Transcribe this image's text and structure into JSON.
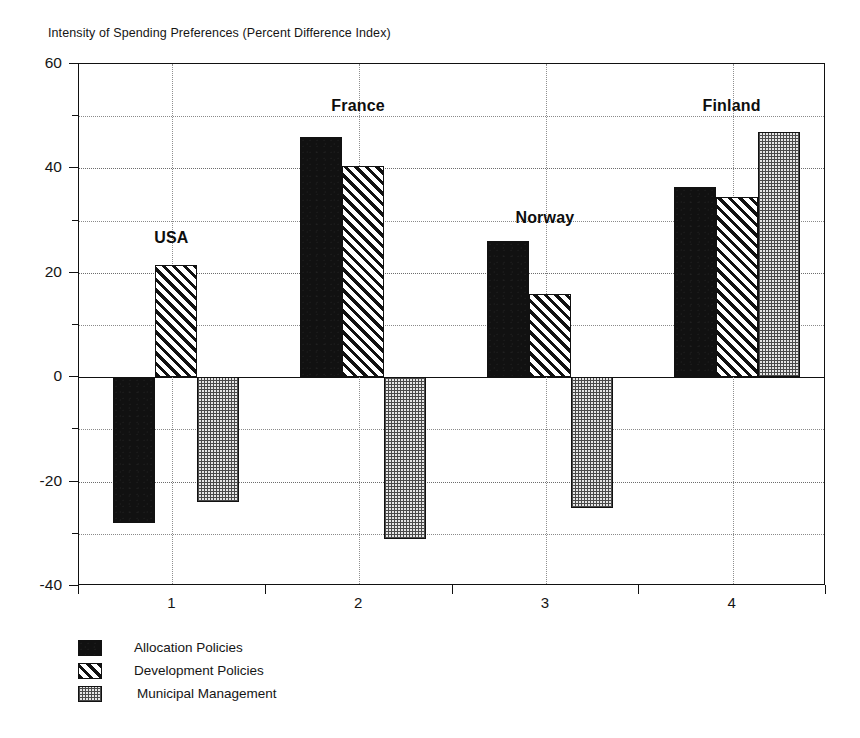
{
  "chart_data": {
    "type": "bar",
    "title": "Intensity of Spending Preferences (Percent Difference Index)",
    "xlabel": "",
    "ylabel": "",
    "ylim": [
      -40,
      60
    ],
    "ytick_labels": [
      "60",
      "40",
      "20",
      "0",
      "-20",
      "-40"
    ],
    "ytick_values": [
      60,
      40,
      20,
      0,
      -20,
      -40
    ],
    "minor_gridline_values": [
      50,
      30,
      10,
      -10,
      -30
    ],
    "grid": true,
    "legend_position": "below-left",
    "categories": [
      "1",
      "2",
      "3",
      "4"
    ],
    "category_annotations": [
      "USA",
      "France",
      "Norway",
      "Finland"
    ],
    "series": [
      {
        "name": "Allocation Policies",
        "pattern": "solid-black",
        "values": [
          -28,
          46,
          26,
          36.5
        ]
      },
      {
        "name": "Development Policies",
        "pattern": "diagonal-hatch",
        "values": [
          21.5,
          40.5,
          16,
          34.5
        ]
      },
      {
        "name": "Municipal Management",
        "pattern": "dotted-checker",
        "values": [
          -24,
          -31,
          -25,
          47
        ]
      }
    ]
  },
  "title": {
    "text": "Intensity of Spending Preferences (Percent Difference Index)"
  },
  "axes": {
    "y_ticks": [
      {
        "label": "60",
        "value": 60
      },
      {
        "label": "40",
        "value": 40
      },
      {
        "label": "20",
        "value": 20
      },
      {
        "label": "0",
        "value": 0
      },
      {
        "label": "-20",
        "value": -20
      },
      {
        "label": "-40",
        "value": -40
      }
    ],
    "x_ticks": [
      {
        "label": "1"
      },
      {
        "label": "2"
      },
      {
        "label": "3"
      },
      {
        "label": "4"
      }
    ]
  },
  "annotations": [
    {
      "label": "USA"
    },
    {
      "label": "France"
    },
    {
      "label": "Norway"
    },
    {
      "label": "Finland"
    }
  ],
  "legend": {
    "items": [
      {
        "label": "Allocation Policies",
        "pattern": "solid-black"
      },
      {
        "label": "Development Policies",
        "pattern": "diagonal-hatch"
      },
      {
        "label": "Municipal Management",
        "pattern": "dotted-checker"
      }
    ]
  },
  "colors": {
    "series_allocation": "#111111",
    "series_development": "#111111",
    "series_municipal": "#e6e6e6",
    "axis": "#111111",
    "grid": "#8a8a8a",
    "background": "#ffffff"
  }
}
